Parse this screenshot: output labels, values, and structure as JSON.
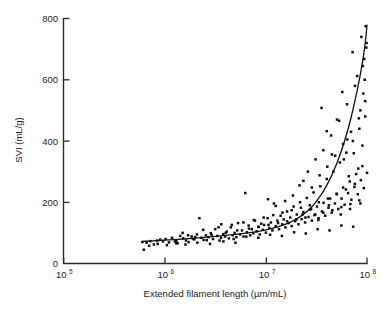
{
  "chart_data": {
    "type": "scatter",
    "title": "",
    "xlabel": "Extended filament length (µm/mL)",
    "ylabel": "SVI (mL/g)",
    "xscale": "log",
    "yscale": "linear",
    "xlim": [
      100000,
      100000000
    ],
    "ylim": [
      0,
      800
    ],
    "grid": false,
    "legend": null,
    "xticks": [
      {
        "value": 100000,
        "label": "10",
        "exponent": "5"
      },
      {
        "value": 1000000,
        "label": "10",
        "exponent": "6"
      },
      {
        "value": 10000000,
        "label": "10",
        "exponent": "7"
      },
      {
        "value": 100000000,
        "label": "10",
        "exponent": "8"
      }
    ],
    "yticks": [
      {
        "value": 0,
        "label": "0"
      },
      {
        "value": 200,
        "label": "200"
      },
      {
        "value": 400,
        "label": "400"
      },
      {
        "value": 600,
        "label": "600"
      },
      {
        "value": 800,
        "label": "800"
      }
    ],
    "series": [
      {
        "name": "observations",
        "type": "scatter",
        "marker": "filled-square",
        "color": "#111111",
        "points": [
          [
            600000.0,
            70
          ],
          [
            620000.0,
            45
          ],
          [
            660000.0,
            68
          ],
          [
            720000.0,
            73
          ],
          [
            780000.0,
            62
          ],
          [
            840000.0,
            75
          ],
          [
            900000.0,
            78
          ],
          [
            960000.0,
            72
          ],
          [
            1020000.0,
            80
          ],
          [
            1100000.0,
            69
          ],
          [
            1180000.0,
            84
          ],
          [
            1260000.0,
            72
          ],
          [
            1340000.0,
            66
          ],
          [
            1420000.0,
            90
          ],
          [
            1520000.0,
            82
          ],
          [
            1620000.0,
            75
          ],
          [
            1720000.0,
            70
          ],
          [
            1840000.0,
            88
          ],
          [
            1960000.0,
            79
          ],
          [
            2080000.0,
            95
          ],
          [
            2200000.0,
            148
          ],
          [
            2300000.0,
            84
          ],
          [
            2420000.0,
            77
          ],
          [
            2550000.0,
            92
          ],
          [
            2700000.0,
            86
          ],
          [
            2850000.0,
            99
          ],
          [
            3000000.0,
            80
          ],
          [
            3150000.0,
            112
          ],
          [
            3300000.0,
            90
          ],
          [
            3480000.0,
            75
          ],
          [
            3620000.0,
            128
          ],
          [
            3780000.0,
            96
          ],
          [
            3950000.0,
            88
          ],
          [
            4100000.0,
            104
          ],
          [
            4300000.0,
            82
          ],
          [
            4500000.0,
            118
          ],
          [
            4700000.0,
            92
          ],
          [
            4900000.0,
            100
          ],
          [
            5100000.0,
            86
          ],
          [
            5300000.0,
            132
          ],
          [
            5550000.0,
            95
          ],
          [
            5800000.0,
            108
          ],
          [
            6000000.0,
            88
          ],
          [
            6250000.0,
            230
          ],
          [
            6500000.0,
            102
          ],
          [
            6750000.0,
            124
          ],
          [
            7000000.0,
            92
          ],
          [
            7250000.0,
            112
          ],
          [
            7500000.0,
            99
          ],
          [
            7800000.0,
            140
          ],
          [
            8100000.0,
            105
          ],
          [
            8400000.0,
            119
          ],
          [
            8700000.0,
            95
          ],
          [
            9000000.0,
            130
          ],
          [
            9300000.0,
            110
          ],
          [
            9600000.0,
            126
          ],
          [
            10000000.0,
            101
          ],
          [
            10400000.0,
            148
          ],
          [
            10800000.0,
            116
          ],
          [
            11200000.0,
            134
          ],
          [
            11600000.0,
            108
          ],
          [
            12000000.0,
            196
          ],
          [
            12500000.0,
            122
          ],
          [
            13000000.0,
            140
          ],
          [
            13500000.0,
            112
          ],
          [
            14000000.0,
            156
          ],
          [
            14500000.0,
            128
          ],
          [
            15000000.0,
            144
          ],
          [
            15600000.0,
            118
          ],
          [
            16200000.0,
            170
          ],
          [
            16800000.0,
            132
          ],
          [
            17400000.0,
            150
          ],
          [
            18000000.0,
            122
          ],
          [
            18800000.0,
            186
          ],
          [
            19500000.0,
            138
          ],
          [
            20200000.0,
            160
          ],
          [
            21000000.0,
            128
          ],
          [
            21800000.0,
            200
          ],
          [
            22600000.0,
            145
          ],
          [
            23500000.0,
            168
          ],
          [
            24400000.0,
            134
          ],
          [
            25400000.0,
            214
          ],
          [
            26400000.0,
            152
          ],
          [
            27400000.0,
            176
          ],
          [
            28500000.0,
            140
          ],
          [
            29600000.0,
            232
          ],
          [
            30800000.0,
            160
          ],
          [
            32000000.0,
            186
          ],
          [
            33200000.0,
            148
          ],
          [
            34500000.0,
            252
          ],
          [
            35800000.0,
            170
          ],
          [
            37200000.0,
            198
          ],
          [
            38600000.0,
            156
          ],
          [
            40000000.0,
            276
          ],
          [
            41600000.0,
            182
          ],
          [
            43200000.0,
            212
          ],
          [
            44800000.0,
            166
          ],
          [
            46500000.0,
            300
          ],
          [
            48200000.0,
            196
          ],
          [
            50000000.0,
            228
          ],
          [
            52000000.0,
            178
          ],
          [
            54000000.0,
            330
          ],
          [
            56000000.0,
            212
          ],
          [
            58000000.0,
            248
          ],
          [
            60000000.0,
            192
          ],
          [
            62500000.0,
            362
          ],
          [
            65000000.0,
            230
          ],
          [
            67500000.0,
            268
          ],
          [
            70000000.0,
            208
          ],
          [
            72500000.0,
            400
          ],
          [
            75000000.0,
            250
          ],
          [
            78000000.0,
            292
          ],
          [
            81000000.0,
            226
          ],
          [
            84000000.0,
            440
          ],
          [
            87000000.0,
            272
          ],
          [
            90000000.0,
            318
          ],
          [
            93000000.0,
            246
          ],
          [
            96000000.0,
            480
          ],
          [
            100000000.0,
            296
          ],
          [
            1500000.0,
            100
          ],
          [
            1700000.0,
            92
          ],
          [
            2000000.0,
            86
          ],
          [
            2400000.0,
            110
          ],
          [
            2900000.0,
            94
          ],
          [
            3400000.0,
            118
          ],
          [
            4000000.0,
            100
          ],
          [
            4600000.0,
            126
          ],
          [
            5200000.0,
            108
          ],
          [
            6000000.0,
            134
          ],
          [
            6800000.0,
            114
          ],
          [
            7600000.0,
            142
          ],
          [
            8500000.0,
            120
          ],
          [
            9500000.0,
            150
          ],
          [
            10600000.0,
            126
          ],
          [
            11800000.0,
            158
          ],
          [
            13200000.0,
            132
          ],
          [
            14600000.0,
            166
          ],
          [
            16200000.0,
            138
          ],
          [
            18000000.0,
            174
          ],
          [
            20000000.0,
            144
          ],
          [
            22200000.0,
            182
          ],
          [
            24600000.0,
            150
          ],
          [
            27200000.0,
            190
          ],
          [
            30200000.0,
            158
          ],
          [
            33400000.0,
            200
          ],
          [
            37000000.0,
            166
          ],
          [
            41000000.0,
            212
          ],
          [
            45500000.0,
            174
          ],
          [
            50400000.0,
            226
          ],
          [
            55800000.0,
            184
          ],
          [
            61800000.0,
            242
          ],
          [
            68500000.0,
            194
          ],
          [
            75800000.0,
            260
          ],
          [
            84000000.0,
            206
          ],
          [
            1300000.0,
            74
          ],
          [
            1900000.0,
            80
          ],
          [
            2600000.0,
            76
          ],
          [
            3600000.0,
            84
          ],
          [
            4800000.0,
            80
          ],
          [
            6400000.0,
            88
          ],
          [
            8400000.0,
            84
          ],
          [
            11000000.0,
            94
          ],
          [
            14400000.0,
            90
          ],
          [
            19000000.0,
            102
          ],
          [
            24800000.0,
            98
          ],
          [
            32500000.0,
            112
          ],
          [
            42600000.0,
            108
          ],
          [
            55800000.0,
            124
          ],
          [
            73000000.0,
            120
          ],
          [
            21500000.0,
            255
          ],
          [
            23500000.0,
            270
          ],
          [
            26000000.0,
            300
          ],
          [
            28500000.0,
            248
          ],
          [
            31000000.0,
            340
          ],
          [
            34000000.0,
            288
          ],
          [
            37000000.0,
            370
          ],
          [
            40500000.0,
            316
          ],
          [
            44200000.0,
            418
          ],
          [
            48400000.0,
            352
          ],
          [
            53000000.0,
            466
          ],
          [
            58000000.0,
            390
          ],
          [
            63500000.0,
            520
          ],
          [
            69500000.0,
            430
          ],
          [
            76000000.0,
            580
          ],
          [
            83000000.0,
            474
          ],
          [
            91000000.0,
            645
          ],
          [
            96000000.0,
            530
          ],
          [
            99000000.0,
            720
          ],
          [
            35500000.0,
            508
          ],
          [
            40000000.0,
            432
          ],
          [
            45000000.0,
            356
          ],
          [
            50500000.0,
            470
          ],
          [
            57000000.0,
            560
          ],
          [
            64000000.0,
            405
          ],
          [
            72000000.0,
            690
          ],
          [
            80000000.0,
            612
          ],
          [
            88000000.0,
            740
          ],
          [
            94000000.0,
            668
          ],
          [
            97000000.0,
            775
          ],
          [
            98500000.0,
            705
          ],
          [
            59000000.0,
            340
          ],
          [
            66000000.0,
            285
          ],
          [
            74000000.0,
            360
          ],
          [
            82000000.0,
            310
          ],
          [
            90000000.0,
            385
          ],
          [
            95000000.0,
            600
          ],
          [
            92000000.0,
            555
          ],
          [
            86000000.0,
            500
          ],
          [
            10500000.0,
            210
          ],
          [
            12500000.0,
            188
          ],
          [
            15500000.0,
            204
          ],
          [
            18500000.0,
            222
          ],
          [
            23000000.0,
            160
          ],
          [
            28000000.0,
            178
          ],
          [
            33000000.0,
            142
          ],
          [
            42000000.0,
            190
          ],
          [
            55000000.0,
            160
          ],
          [
            68000000.0,
            178
          ],
          [
            86000000.0,
            196
          ],
          [
            700000.0,
            58
          ],
          [
            850000.0,
            64
          ],
          [
            1050000.0,
            60
          ],
          [
            1300000.0,
            66
          ],
          [
            1600000.0,
            62
          ],
          [
            2100000.0,
            68
          ],
          [
            2800000.0,
            64
          ],
          [
            3800000.0,
            72
          ],
          [
            5000000.0,
            68
          ]
        ]
      },
      {
        "name": "fitted curve",
        "type": "line",
        "color": "#111111",
        "points": [
          [
            600000.0,
            72
          ],
          [
            1000000.0,
            76
          ],
          [
            2000000.0,
            83
          ],
          [
            4000000.0,
            92
          ],
          [
            7000000.0,
            101
          ],
          [
            10000000.0,
            110
          ],
          [
            15000000.0,
            126
          ],
          [
            20000000.0,
            145
          ],
          [
            26000000.0,
            172
          ],
          [
            32000000.0,
            205
          ],
          [
            40000000.0,
            255
          ],
          [
            50000000.0,
            325
          ],
          [
            60000000.0,
            400
          ],
          [
            70000000.0,
            480
          ],
          [
            80000000.0,
            565
          ],
          [
            90000000.0,
            655
          ],
          [
            96000000.0,
            720
          ],
          [
            100000000.0,
            778
          ]
        ]
      }
    ]
  },
  "axes": {
    "x_title": "Extended filament length (µm/mL)",
    "y_title": "SVI (mL/g)"
  }
}
